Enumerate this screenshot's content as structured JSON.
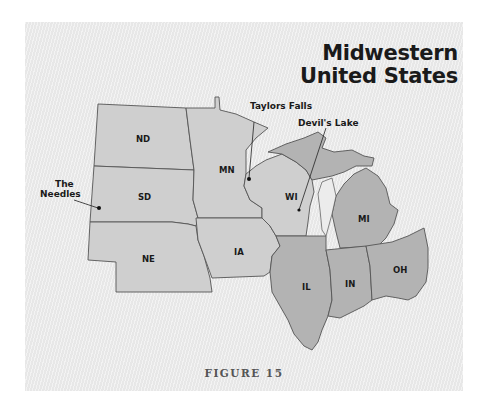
{
  "title": {
    "line1": "Midwestern",
    "line2": "United States"
  },
  "states": [
    {
      "abbr": "ND"
    },
    {
      "abbr": "SD"
    },
    {
      "abbr": "NE"
    },
    {
      "abbr": "MN"
    },
    {
      "abbr": "IA"
    },
    {
      "abbr": "WI"
    },
    {
      "abbr": "IL"
    },
    {
      "abbr": "IN"
    },
    {
      "abbr": "MI"
    },
    {
      "abbr": "OH"
    }
  ],
  "places": [
    {
      "name_line1": "The",
      "name_line2": "Needles"
    },
    {
      "name": "Taylors Falls"
    },
    {
      "name": "Devil's Lake"
    }
  ],
  "caption": "FIGURE 15",
  "colors": {
    "background": "#ececec",
    "state_fill": "#cfcfcf",
    "highlight_fill": "#b3b3b3",
    "border": "#555555"
  }
}
